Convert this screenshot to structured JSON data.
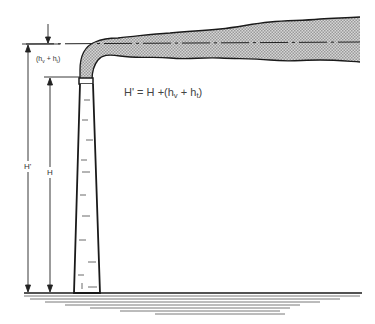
{
  "diagram": {
    "equation": {
      "lhs": "H'",
      "eq": "=",
      "H": "H",
      "plus1": "+",
      "open": "(",
      "hv_base": "h",
      "hv_sub": "v",
      "plus2": "+",
      "ht_base": "h",
      "ht_sub": "t",
      "close": ")"
    },
    "labels": {
      "rise_label": {
        "open": "(",
        "hv_base": "h",
        "hv_sub": "v",
        "plus": "+",
        "ht_base": "h",
        "ht_sub": "t",
        "close": ")"
      },
      "effective_height": "H'",
      "stack_height": "H"
    },
    "colors": {
      "line": "#1a1a1a",
      "plume_fill": "#c8c8c8",
      "ground": "#555555"
    }
  }
}
